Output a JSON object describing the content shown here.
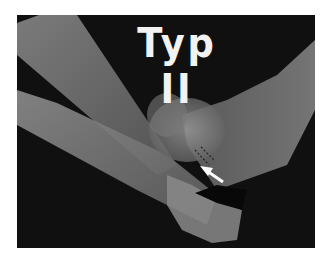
{
  "figure": {
    "title": "Typ II",
    "annotation": "arrow",
    "colors": {
      "background": "#0c0c0c",
      "bone": "#9a9a9a",
      "text": "#f2f2f2",
      "page": "#ffffff"
    }
  }
}
